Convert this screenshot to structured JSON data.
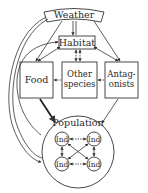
{
  "diagram": {
    "weather": {
      "label": "Weather"
    },
    "habitat": {
      "label": "Habitat"
    },
    "food": {
      "label": "Food"
    },
    "other_species": {
      "line1": "Other",
      "line2": "species"
    },
    "antagonists": {
      "line1": "Antag-",
      "line2": "onists"
    },
    "population": {
      "label": "Population",
      "individuals": [
        "Ind",
        "Ind",
        "Ind",
        "Ind"
      ]
    }
  }
}
